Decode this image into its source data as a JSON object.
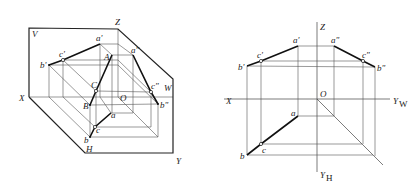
{
  "left_figure": {
    "description": "Three-plane projection system (V, H, W) in axonometric view with triangle ABC and its projections",
    "plane_labels": {
      "V": "V",
      "H": "H",
      "W": "W"
    },
    "axis_labels": {
      "X": "X",
      "Y": "Y",
      "Z": "Z",
      "O": "O"
    },
    "space_points": {
      "A": "A",
      "B": "B",
      "C": "C"
    },
    "front_projections": {
      "a": "a'",
      "b": "b'",
      "c": "c'"
    },
    "top_projections": {
      "a": "a",
      "b": "b",
      "c": "c"
    },
    "side_projections": {
      "a": "a\"",
      "b": "b\"",
      "c": "c\""
    }
  },
  "right_figure": {
    "description": "Unfolded orthographic projection drawing of triangle ABC",
    "axis_labels": {
      "Z": "Z",
      "X": "X",
      "O": "O",
      "Y": "Y",
      "YW_sub": "W",
      "YH_sub": "H"
    },
    "front_projections": {
      "a": "a'",
      "b": "b'",
      "c": "c'"
    },
    "top_projections": {
      "a": "a",
      "b": "b",
      "c": "c"
    },
    "side_projections": {
      "a": "a\"",
      "b": "b\"",
      "c": "c\""
    }
  }
}
